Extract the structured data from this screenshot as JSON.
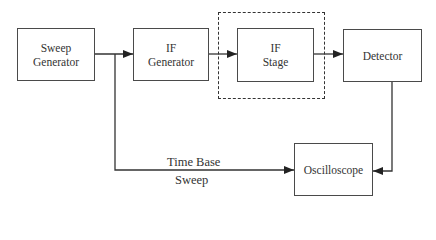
{
  "diagram": {
    "title": "",
    "blocks": [
      {
        "id": "sweep_generator",
        "line1": "Sweep",
        "line2": "Generator"
      },
      {
        "id": "if_generator",
        "line1": "IF",
        "line2": "Generator"
      },
      {
        "id": "if_stage",
        "line1": "IF",
        "line2": "Stage"
      },
      {
        "id": "detector",
        "line1": "Detector"
      },
      {
        "id": "oscilloscope",
        "line1": "Oscilloscope"
      }
    ],
    "group": {
      "id": "device_under_test_boundary",
      "style": "dashed",
      "contains": [
        "if_stage"
      ]
    },
    "connections": [
      {
        "from": "sweep_generator",
        "to": "if_generator"
      },
      {
        "from": "if_generator",
        "to": "if_stage"
      },
      {
        "from": "if_stage",
        "to": "detector"
      },
      {
        "from": "detector",
        "to": "oscilloscope"
      },
      {
        "from": "sweep_generator",
        "to": "oscilloscope",
        "label": "Time Base Sweep"
      }
    ],
    "edge_label": {
      "line1": "Time Base",
      "line2": "Sweep"
    },
    "colors": {
      "stroke": "#333333",
      "background": "#ffffff"
    }
  }
}
